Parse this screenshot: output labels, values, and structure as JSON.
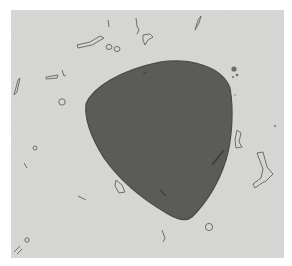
{
  "image": {
    "description": "Grayscale light micrograph of a single large dark rounded-triangular particle surrounded by small outlined debris fragments",
    "colors": {
      "page_background": "#ffffff",
      "field_background": "#d7d7d5",
      "particle_fill": "#5b5b59",
      "particle_edge": "#4a4a48",
      "debris_outline": "#6e6e6c"
    }
  }
}
